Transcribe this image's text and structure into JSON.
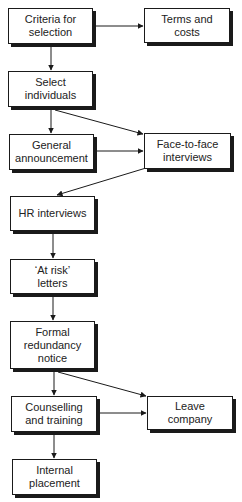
{
  "diagram": {
    "type": "flowchart",
    "nodes": [
      {
        "id": "criteria",
        "label": "Criteria for\nselection",
        "x": 8,
        "y": 8,
        "w": 85,
        "h": 36
      },
      {
        "id": "terms",
        "label": "Terms and\ncosts",
        "x": 144,
        "y": 8,
        "w": 86,
        "h": 35
      },
      {
        "id": "select",
        "label": "Select\nindividuals",
        "x": 8,
        "y": 71,
        "w": 85,
        "h": 36
      },
      {
        "id": "general",
        "label": "General\nannouncement",
        "x": 9,
        "y": 134,
        "w": 85,
        "h": 36
      },
      {
        "id": "facetoface",
        "label": "Face-to-face\ninterviews",
        "x": 144,
        "y": 133,
        "w": 87,
        "h": 36
      },
      {
        "id": "hr",
        "label": "HR interviews",
        "x": 10,
        "y": 196,
        "w": 85,
        "h": 35
      },
      {
        "id": "atrisk",
        "label": "‘At risk’\nletters",
        "x": 10,
        "y": 259,
        "w": 85,
        "h": 35
      },
      {
        "id": "formal",
        "label": "Formal\nredundancy\nnotice",
        "x": 10,
        "y": 321,
        "w": 85,
        "h": 48
      },
      {
        "id": "counselling",
        "label": "Counselling\nand training",
        "x": 11,
        "y": 396,
        "w": 86,
        "h": 36
      },
      {
        "id": "leave",
        "label": "Leave\ncompany",
        "x": 147,
        "y": 396,
        "w": 86,
        "h": 34
      },
      {
        "id": "internal",
        "label": "Internal\nplacement",
        "x": 12,
        "y": 459,
        "w": 85,
        "h": 36
      }
    ],
    "edges": [
      {
        "from": "criteria",
        "to": "terms",
        "x1": 96,
        "y1": 26,
        "x2": 143,
        "y2": 26
      },
      {
        "from": "criteria",
        "to": "select",
        "x1": 51,
        "y1": 47,
        "x2": 51,
        "y2": 70
      },
      {
        "from": "select",
        "to": "general",
        "x1": 51,
        "y1": 110,
        "x2": 51,
        "y2": 133
      },
      {
        "from": "select",
        "to": "facetoface",
        "x1": 55,
        "y1": 110,
        "x2": 143,
        "y2": 134
      },
      {
        "from": "general",
        "to": "facetoface",
        "x1": 97,
        "y1": 151,
        "x2": 143,
        "y2": 151
      },
      {
        "from": "facetoface",
        "to": "hr",
        "x1": 146,
        "y1": 168,
        "x2": 57,
        "y2": 195
      },
      {
        "from": "hr",
        "to": "atrisk",
        "x1": 53,
        "y1": 234,
        "x2": 53,
        "y2": 258
      },
      {
        "from": "atrisk",
        "to": "formal",
        "x1": 53,
        "y1": 297,
        "x2": 53,
        "y2": 320
      },
      {
        "from": "formal",
        "to": "counselling",
        "x1": 54,
        "y1": 372,
        "x2": 54,
        "y2": 395
      },
      {
        "from": "formal",
        "to": "leave",
        "x1": 58,
        "y1": 372,
        "x2": 146,
        "y2": 396
      },
      {
        "from": "counselling",
        "to": "leave",
        "x1": 100,
        "y1": 413,
        "x2": 146,
        "y2": 413
      },
      {
        "from": "counselling",
        "to": "internal",
        "x1": 54,
        "y1": 435,
        "x2": 54,
        "y2": 458
      }
    ],
    "colors": {
      "stroke": "#1a1a1a",
      "fill": "#ffffff",
      "shadow": "#1a1a1a"
    }
  }
}
